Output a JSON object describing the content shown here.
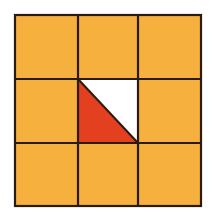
{
  "diagram": {
    "type": "3x3 grid with one cell split diagonally",
    "grid": {
      "rows": 3,
      "cols": 3
    },
    "colors": {
      "cell_fill": "#f6b03e",
      "shaded_triangle": "#e2401f",
      "unshaded_triangle": "#ffffff",
      "lines": "#2a1a10",
      "background": "#ffffff"
    },
    "special_cell": {
      "row": 1,
      "col": 1,
      "diagonal": "top-left to bottom-right",
      "lower_left_triangle": "shaded",
      "upper_right_triangle": "white"
    }
  }
}
